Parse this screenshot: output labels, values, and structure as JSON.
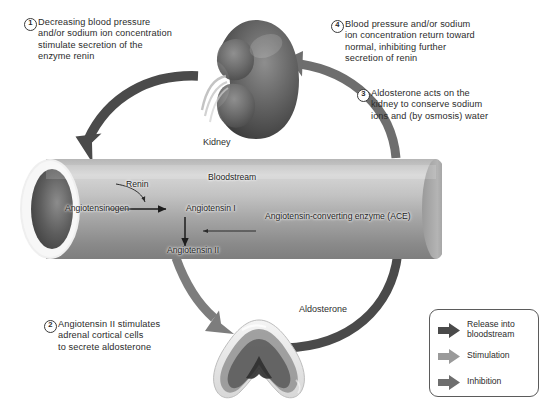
{
  "diagram": {
    "background": "#ffffff"
  },
  "steps": [
    {
      "number": "1",
      "text": "Decreasing blood pressure\nand/or sodium ion concentration\nstimulate secretion of the\nenzyme renin"
    },
    {
      "number": "2",
      "text": "Angiotensin II stimulates\nadrenal cortical cells\nto secrete aldosterone"
    },
    {
      "number": "3",
      "text": "Aldosterone acts on the\nkidney to conserve sodium\nions and (by osmosis) water"
    },
    {
      "number": "4",
      "text": "Blood pressure and/or sodium\nion concentration return toward\nnormal, inhibiting further\nsecretion of renin"
    }
  ],
  "anatomy": {
    "kidney_label": "Kidney",
    "adrenal_name": "adrenal-gland"
  },
  "bloodstream": {
    "label": "Bloodstream",
    "molecules": {
      "angiotensinogen": "Angiotensinogen",
      "angiotensin_1": "Angiotensin I",
      "angiotensin_2": "Angiotensin II",
      "renin": "Renin",
      "ace": "Angiotensin-converting\nenzyme (ACE)"
    }
  },
  "pathway": {
    "aldosterone_label": "Aldosterone"
  },
  "legend": {
    "items": [
      {
        "label": "Release into\nbloodstream",
        "color": "#4a4a4a",
        "name": "release-into-bloodstream"
      },
      {
        "label": "Stimulation",
        "color": "#9a9a9a",
        "name": "stimulation"
      },
      {
        "label": "Inhibition",
        "color": "#6e6e6e",
        "name": "inhibition"
      }
    ]
  },
  "colors": {
    "arrow_dark": "#4a4a4a",
    "arrow_mid": "#7d7d7d",
    "arrow_light": "#9a9a9a",
    "tube_light": "#c9c9c9",
    "tube_dark": "#8d8d8d",
    "text": "#2b2b2b"
  }
}
